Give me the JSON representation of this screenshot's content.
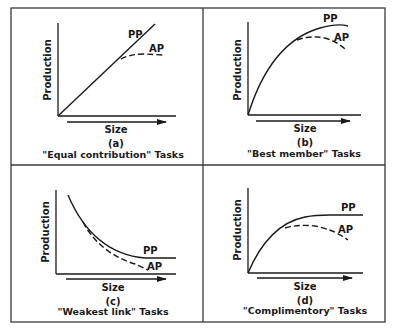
{
  "figure": {
    "frame_color": "#3a3a3a",
    "ink_color": "#1a1a1a",
    "panels": [
      {
        "id": "a",
        "letter": "(a)",
        "caption": "\"Equal contribution\" Tasks",
        "y_axis_label": "Production",
        "x_axis_label": "Size",
        "curves": [
          {
            "name": "PP",
            "style": "solid",
            "label": "PP"
          },
          {
            "name": "AP",
            "style": "dashed",
            "label": "AP"
          }
        ]
      },
      {
        "id": "b",
        "letter": "(b)",
        "caption": "\"Best member\" Tasks",
        "y_axis_label": "Production",
        "x_axis_label": "Size",
        "curves": [
          {
            "name": "PP",
            "style": "solid",
            "label": "PP"
          },
          {
            "name": "AP",
            "style": "dashed",
            "label": "AP"
          }
        ]
      },
      {
        "id": "c",
        "letter": "(c)",
        "caption": "\"Weakest link\" Tasks",
        "y_axis_label": "Production",
        "x_axis_label": "Size",
        "curves": [
          {
            "name": "PP",
            "style": "solid",
            "label": "PP"
          },
          {
            "name": "AP",
            "style": "dashed",
            "label": "AP"
          }
        ]
      },
      {
        "id": "d",
        "letter": "(d)",
        "caption": "\"Complimentory\" Tasks",
        "y_axis_label": "Production",
        "x_axis_label": "Size",
        "curves": [
          {
            "name": "PP",
            "style": "solid",
            "label": "PP"
          },
          {
            "name": "AP",
            "style": "dashed",
            "label": "AP"
          }
        ]
      }
    ]
  }
}
